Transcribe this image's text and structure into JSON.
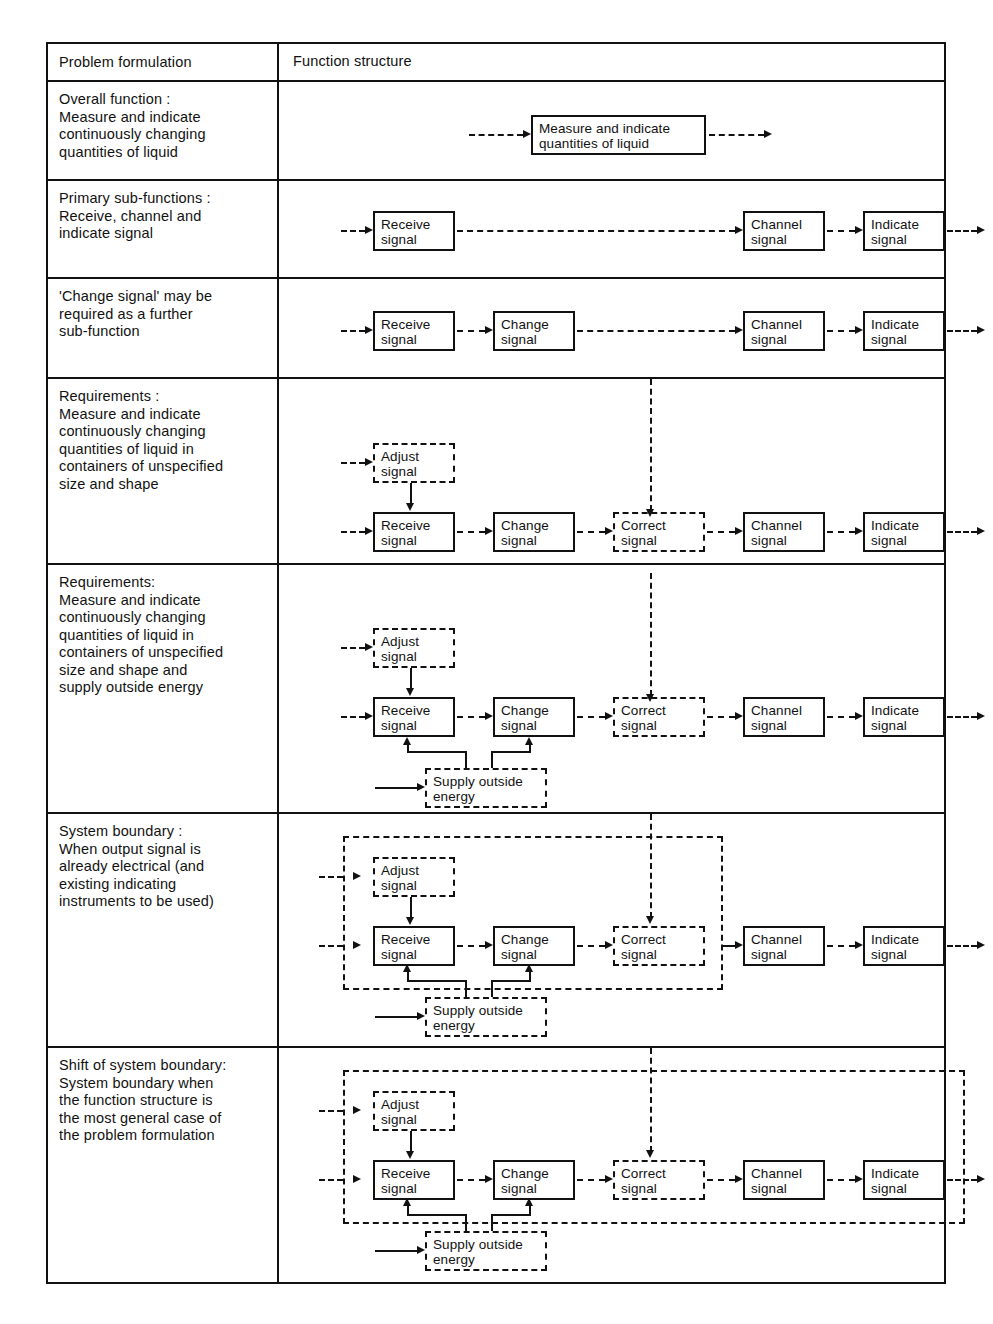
{
  "table": {
    "headers": {
      "left": "Problem formulation",
      "right": "Function structure"
    },
    "rows": [
      {
        "id": "overall-function",
        "label": "Overall function :\nMeasure and indicate\ncontinuously changing\nquantities of liquid"
      },
      {
        "id": "primary-sub-functions",
        "label": "Primary sub-functions :\nReceive, channel and\nindicate signal"
      },
      {
        "id": "change-signal",
        "label": "'Change signal' may be\nrequired as a further\nsub-function"
      },
      {
        "id": "requirements-1",
        "label": "Requirements :\nMeasure and indicate\ncontinuously changing\nquantities of liquid in\ncontainers of unspecified\nsize and shape"
      },
      {
        "id": "requirements-2",
        "label": "Requirements:\nMeasure and indicate\ncontinuously changing\nquantities of liquid in\ncontainers of unspecified\nsize and shape and\nsupply outside energy"
      },
      {
        "id": "system-boundary",
        "label": "System boundary :\nWhen output signal is\nalready electrical (and\nexisting indicating\ninstruments to be used)"
      },
      {
        "id": "shift-of-system-boundary",
        "label": "Shift of system boundary:\nSystem boundary when\nthe function structure is\nthe most general case of\nthe problem formulation"
      }
    ]
  },
  "blocks": {
    "measure_indicate": "Measure and indicate\nquantities of liquid",
    "receive": "Receive\nsignal",
    "change": "Change\nsignal",
    "correct": "Correct\nsignal",
    "channel": "Channel\nsignal",
    "indicate": "Indicate\nsignal",
    "adjust": "Adjust\nsignal",
    "supply": "Supply outside\nenergy"
  },
  "colors": {
    "line": "#111111",
    "background": "#ffffff"
  }
}
